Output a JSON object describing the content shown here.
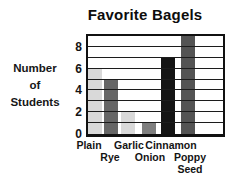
{
  "chart_data": {
    "type": "bar",
    "title": "Favorite Bagels",
    "ylabel": "Number of Students",
    "ylabel_lines": [
      "Number",
      "of",
      "Students"
    ],
    "xlabel": "",
    "categories": [
      "Plain",
      "Rye",
      "Garlic",
      "Onion",
      "Cinnamon",
      "Poppy Seed"
    ],
    "tick_label_lines": [
      [
        "Plain"
      ],
      [
        "Rye"
      ],
      [
        "Garlic"
      ],
      [
        "Onion"
      ],
      [
        "Cinnamon"
      ],
      [
        "Poppy",
        "Seed"
      ]
    ],
    "values": [
      6,
      5,
      2,
      1,
      7,
      9
    ],
    "bar_colors": [
      "#d9d9d9",
      "#666666",
      "#d9d9d9",
      "#7f7f7f",
      "#141414",
      "#545454"
    ],
    "ylim": [
      0,
      9
    ],
    "yticks": [
      0,
      2,
      4,
      6,
      8
    ],
    "grid": "horizontal lines every 1 unit, drawn over bars",
    "legend": "none",
    "axis_color": "#111111",
    "background_color": "#ffffff"
  }
}
